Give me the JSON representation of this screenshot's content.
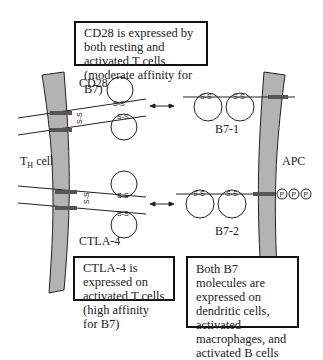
{
  "boxes": {
    "cd28_note": "CD28 is expressed by both resting and activated T cells (moderate affinity for B7)",
    "ctla4_note": "CTLA-4 is expressed on activated T cells (high affinity for B7)",
    "b7_note": "Both B7 molecules are expressed on dendritic cells, activated macrophages, and activated B cells"
  },
  "labels": {
    "cd28": "CD28",
    "ctla4": "CTLA-4",
    "b7_1": "B7-1",
    "b7_2": "B7-2",
    "th_cell": "T",
    "th_sub": "H",
    "th_rest": " cell",
    "apc": "APC",
    "disulfide": "S-S",
    "phospho": "P"
  },
  "colors": {
    "membrane": "#b3b3b3",
    "line": "#222222"
  }
}
